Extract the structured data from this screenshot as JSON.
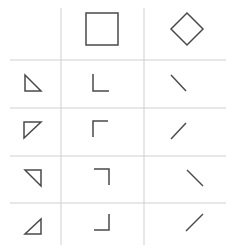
{
  "diagram": {
    "colors": {
      "grid": "#cfcfcf",
      "stroke": "#4a4a4a",
      "background": "#ffffff"
    },
    "grid": {
      "vertical_lines_x": [
        61,
        144
      ],
      "vertical_range_y": [
        8,
        245
      ],
      "horizontal_lines_y": [
        60,
        108,
        156,
        203
      ],
      "horizontal_range_x": [
        10,
        226
      ]
    },
    "header": [
      {
        "name": "empty-header-cell",
        "shape": "none"
      },
      {
        "name": "square",
        "shape": "square",
        "points": "86,13 118,13 118,45 86,45"
      },
      {
        "name": "diamond",
        "shape": "diamond",
        "points": "187,13 203,29 187,45 171,29"
      }
    ],
    "rows": [
      {
        "name": "row-1",
        "triangle": {
          "orientation": "right-angle-bottom-left",
          "points": "25,75 25,91 41,91"
        },
        "corner": {
          "orientation": "bottom-left",
          "points": "93,74 93,91 109,91"
        },
        "diagonal": {
          "orientation": "descending",
          "points": "171,75 186,91"
        }
      },
      {
        "name": "row-2",
        "triangle": {
          "orientation": "right-angle-top-left",
          "points": "24,122 41,122 24,138"
        },
        "corner": {
          "orientation": "top-left",
          "points": "93,137 93,121 108,121"
        },
        "diagonal": {
          "orientation": "ascending",
          "points": "186,123 171,139"
        }
      },
      {
        "name": "row-3",
        "triangle": {
          "orientation": "right-angle-top-right",
          "points": "25,170 41,170 41,186"
        },
        "corner": {
          "orientation": "top-right",
          "points": "94,169 109,169 109,185"
        },
        "diagonal": {
          "orientation": "descending",
          "points": "187,170 203,186"
        }
      },
      {
        "name": "row-4",
        "triangle": {
          "orientation": "right-angle-bottom-right",
          "points": "41,219 41,234 25,234"
        },
        "corner": {
          "orientation": "bottom-right",
          "points": "109,214 109,230 94,230"
        },
        "diagonal": {
          "orientation": "ascending",
          "points": "203,214 186,231"
        }
      }
    ]
  }
}
